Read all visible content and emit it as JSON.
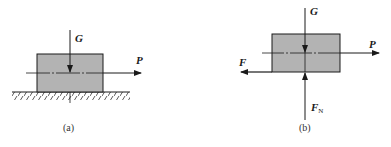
{
  "colors": {
    "block_fill": "#b3b3b3",
    "stroke": "#1a1a1a",
    "background": "#ffffff"
  },
  "figures": [
    {
      "id": "a",
      "caption": "(a)",
      "description": "Block resting on hatched ground with weight G and horizontal pull P",
      "forces": [
        {
          "label": "G",
          "direction": "down"
        },
        {
          "label": "P",
          "direction": "right"
        }
      ],
      "has_ground": true
    },
    {
      "id": "b",
      "caption": "(b)",
      "description": "Free-body diagram of block with G, P, friction F and normal force FN",
      "forces": [
        {
          "label": "G",
          "direction": "down"
        },
        {
          "label": "P",
          "direction": "right"
        },
        {
          "label": "F",
          "direction": "left"
        },
        {
          "label": "F",
          "subscript": "N",
          "direction": "up"
        }
      ],
      "has_ground": false
    }
  ]
}
